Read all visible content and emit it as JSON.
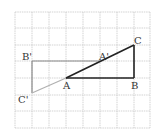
{
  "diagram": {
    "grid": {
      "x_lines": [
        15,
        32,
        49,
        66,
        83,
        100,
        117,
        134,
        150
      ],
      "y_lines": [
        12,
        28,
        45,
        61,
        78,
        95,
        111,
        128
      ],
      "color": "#c8c8c8"
    },
    "points": {
      "A": {
        "label": "A",
        "x": 66,
        "y": 78
      },
      "B": {
        "label": "B",
        "x": 134,
        "y": 78
      },
      "C": {
        "label": "C",
        "x": 134,
        "y": 45
      },
      "A_prime": {
        "label": "A'",
        "x": 100,
        "y": 61
      },
      "B_prime": {
        "label": "B'",
        "x": 32,
        "y": 61
      },
      "C_prime": {
        "label": "C'",
        "x": 32,
        "y": 93
      }
    },
    "colors": {
      "original_triangle": "#222222",
      "image_triangle": "#8a8a8a",
      "extension": "#b0b0b0"
    }
  }
}
